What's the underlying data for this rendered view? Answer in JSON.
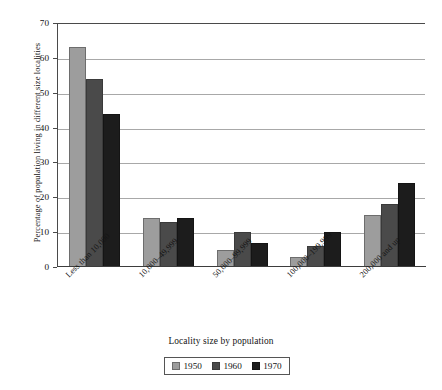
{
  "chart_data": {
    "type": "bar",
    "title": "",
    "xlabel": "Locality size by population",
    "ylabel": "Percentage of population living in different size localities",
    "categories": [
      "Less than 10,000",
      "10,000–49,999",
      "50,000–99,999",
      "100,000–199,999",
      "200,000 and up"
    ],
    "series": [
      {
        "name": "1950",
        "color": "#9d9d9d",
        "values": [
          63,
          14,
          5,
          3,
          15
        ]
      },
      {
        "name": "1960",
        "color": "#4a4a4a",
        "values": [
          54,
          13,
          10,
          6,
          18
        ]
      },
      {
        "name": "1970",
        "color": "#1c1c1c",
        "values": [
          44,
          14,
          7,
          10,
          24
        ]
      }
    ],
    "ylim": [
      0,
      70
    ],
    "yticks": [
      0,
      10,
      20,
      30,
      40,
      50,
      60,
      70
    ],
    "ytick_labels": [
      "0",
      "10",
      "20",
      "30",
      "40",
      "50",
      "60",
      "70"
    ],
    "grid": true,
    "legend_position": "bottom",
    "legend_entries": [
      "1950",
      "1960",
      "1970"
    ]
  }
}
